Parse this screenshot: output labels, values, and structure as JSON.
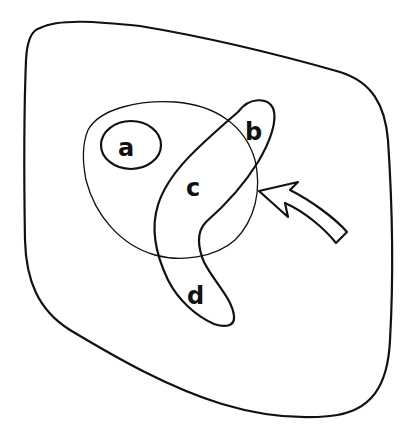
{
  "diagram": {
    "type": "hand-drawn set diagram",
    "labels": {
      "a": "a",
      "b": "b",
      "c": "c",
      "d": "d"
    },
    "elements": [
      {
        "id": "universe",
        "description": "outer closed boundary region"
      },
      {
        "id": "circle",
        "description": "thin-lined round set"
      },
      {
        "id": "region-a",
        "description": "small oval inside circle labeled a"
      },
      {
        "id": "boomerang",
        "description": "curved boomerang-shaped set overlapping circle; b = part outside circle at top, c = overlap, d = part outside circle at bottom"
      },
      {
        "id": "arrow",
        "description": "curved hollow arrow pointing to circle boundary from the right"
      }
    ],
    "colors": {
      "stroke": "#111111",
      "background": "#ffffff"
    }
  }
}
